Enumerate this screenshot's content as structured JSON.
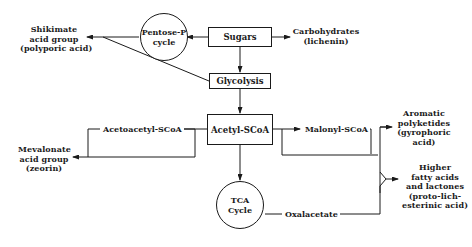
{
  "diagram": {
    "type": "metabolic-pathway-flowchart",
    "nodes": {
      "sugars": {
        "label": "Sugars",
        "shape": "box"
      },
      "glycolysis": {
        "label": "Glycolysis",
        "shape": "box"
      },
      "acetyl_scoa": {
        "label": "Acetyl-SCoA",
        "shape": "box"
      },
      "pentose_p": {
        "line1": "Pentose-P",
        "line2": "cycle",
        "shape": "circle"
      },
      "tca": {
        "line1": "TCA",
        "line2": "Cycle",
        "shape": "circle"
      },
      "carbohydrates": {
        "line1": "Carbohydrates",
        "line2": "(lichenin)"
      },
      "shikimate": {
        "line1": "Shikimate",
        "line2": "acid group",
        "line3": "(polyporic acid)"
      },
      "mevalonate": {
        "line1": "Mevalonate",
        "line2": "acid group",
        "line3": "(zeorin)"
      },
      "acetoacetyl": {
        "label": "Acetoacetyl-SCoA"
      },
      "malonyl": {
        "label": "Malonyl-SCoA"
      },
      "oxalacetate": {
        "label": "Oxalacetate"
      },
      "aromatic": {
        "line1": "Aromatic",
        "line2": "polyketides",
        "line3": "(gyrophoric",
        "line4": "acid)"
      },
      "higher_fatty": {
        "line1": "Higher",
        "line2": "fatty acids",
        "line3": "and lactones",
        "line4": "(proto-lich-",
        "line5": "esterinic acid)"
      }
    },
    "edges": [
      {
        "from": "Sugars",
        "to": "Pentose-P cycle"
      },
      {
        "from": "Sugars",
        "to": "Carbohydrates (lichenin)"
      },
      {
        "from": "Sugars",
        "to": "Glycolysis"
      },
      {
        "from": "Pentose-P cycle",
        "to": "Shikimate acid group"
      },
      {
        "from": "Glycolysis",
        "to": "Shikimate acid group"
      },
      {
        "from": "Glycolysis",
        "to": "Acetyl-SCoA"
      },
      {
        "from": "Acetyl-SCoA",
        "to": "Acetoacetyl-SCoA"
      },
      {
        "from": "Acetoacetyl-SCoA",
        "to": "Mevalonate acid group"
      },
      {
        "from": "Acetyl-SCoA",
        "to": "Malonyl-SCoA"
      },
      {
        "from": "Malonyl-SCoA",
        "to": "Aromatic polyketides"
      },
      {
        "from": "Acetyl-SCoA",
        "to": "Higher fatty acids and lactones"
      },
      {
        "from": "Acetyl-SCoA",
        "to": "TCA Cycle"
      },
      {
        "from": "TCA Cycle",
        "to": "Oxalacetate"
      },
      {
        "from": "Oxalacetate",
        "to": "Higher fatty acids and lactones"
      }
    ]
  }
}
